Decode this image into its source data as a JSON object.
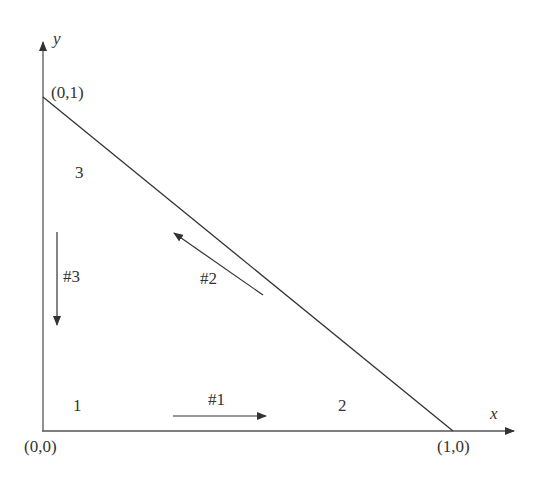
{
  "diagram": {
    "type": "triangle-element-edges",
    "axes": {
      "x_label": "x",
      "y_label": "y"
    },
    "vertices": [
      {
        "id": "1",
        "coord_label": "(0,0)",
        "node_label": "1"
      },
      {
        "id": "2",
        "coord_label": "(1,0)",
        "node_label": "2"
      },
      {
        "id": "3",
        "coord_label": "(0,1)",
        "node_label": "3"
      }
    ],
    "edges": [
      {
        "id": "#1",
        "label": "#1",
        "direction": "1 to 2 (rightward)"
      },
      {
        "id": "#2",
        "label": "#2",
        "direction": "2 to 3 (up-left)"
      },
      {
        "id": "#3",
        "label": "#3",
        "direction": "3 to 1 (downward)"
      }
    ],
    "colors": {
      "line": "#333333",
      "background": "#ffffff"
    }
  }
}
